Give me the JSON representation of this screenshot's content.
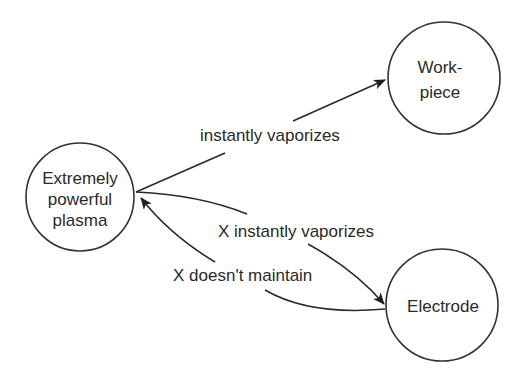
{
  "diagram": {
    "type": "directed-graph",
    "nodes": [
      {
        "id": "plasma",
        "lines": [
          "Extremely",
          "powerful",
          "plasma"
        ],
        "cx": 80,
        "cy": 197,
        "r": 54
      },
      {
        "id": "workpiece",
        "lines": [
          "Work-",
          "piece"
        ],
        "cx": 444,
        "cy": 78,
        "r": 56
      },
      {
        "id": "electrode",
        "lines": [
          "Electrode"
        ],
        "cx": 442,
        "cy": 305,
        "r": 56
      }
    ],
    "edges": [
      {
        "from": "plasma",
        "to": "workpiece",
        "label": "instantly vaporizes"
      },
      {
        "from": "plasma",
        "to": "electrode",
        "label": "X instantly vaporizes"
      },
      {
        "from": "electrode",
        "to": "plasma",
        "label": "X doesn't maintain"
      }
    ],
    "colors": {
      "stroke": "#2a2a2a",
      "background": "#ffffff",
      "text": "#2a2a2a"
    }
  }
}
